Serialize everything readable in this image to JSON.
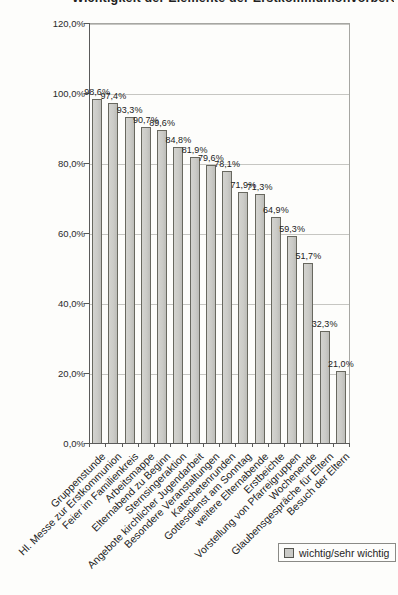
{
  "title": {
    "text": "Wichtigkeit der Elemente der Erstkommunionvorbereitung"
  },
  "legend": {
    "label": "wichtig/sehr wichtig"
  },
  "chart_data": {
    "type": "bar",
    "title": "Wichtigkeit der Elemente der Erstkommunionvorbereitung",
    "categories": [
      "Gruppenstunde",
      "Hl. Messe zur Erstkommunion",
      "Feier im Familienkreis",
      "Arbeitsmappe",
      "Elternabend zu Beginn",
      "Sternsingeraktion",
      "Angebote kirchlicher Jugendarbeit",
      "Besondere Veranstaltungen",
      "Katechetenrunden",
      "Gottesdienst am Sonntag",
      "weitere Elternabende",
      "Erstbeichte",
      "Vorstellung von Pfarreigruppen",
      "Wochenende",
      "Glaubensgespräche für Eltern",
      "Besuch der Eltern"
    ],
    "values": [
      98.6,
      97.4,
      93.3,
      90.7,
      89.6,
      84.8,
      81.9,
      79.6,
      78.1,
      71.9,
      71.3,
      64.9,
      59.3,
      51.7,
      32.3,
      21.0
    ],
    "value_labels": [
      "98,6%",
      "97,4%",
      "93,3%",
      "90,7%",
      "89,6%",
      "84,8%",
      "81,9%",
      "79,6%",
      "78,1%",
      "71,9%",
      "71,3%",
      "64,9%",
      "59,3%",
      "51,7%",
      "32,3%",
      "21,0%"
    ],
    "y_ticks": [
      "0,0%",
      "20,0%",
      "40,0%",
      "60,0%",
      "80,0%",
      "100,0%",
      "120,0%"
    ],
    "ylim": [
      0,
      120
    ],
    "grid": true,
    "xlabel": "",
    "ylabel": "",
    "legend": [
      "wichtig/sehr wichtig"
    ],
    "legend_position": "bottom-right",
    "bar_fill_color": "#cacac6",
    "bar_border_color": "#68685f",
    "gridline_color": "#c6c6c2",
    "axis_color": "#5a5a5a"
  }
}
